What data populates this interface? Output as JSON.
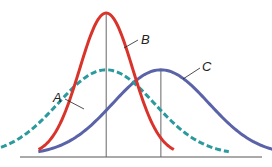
{
  "chart_data": {
    "type": "line",
    "title": "",
    "xlabel": "",
    "ylabel": "",
    "grid": false,
    "legend": "none (curves labeled directly)",
    "series": [
      {
        "name": "A",
        "label": "A",
        "mean": 0,
        "sd": 1.45,
        "peak": 0.6,
        "style": "dashed",
        "color": "#2a9a9e"
      },
      {
        "name": "B",
        "label": "B",
        "mean": 0,
        "sd": 0.8,
        "peak": 1.0,
        "style": "solid",
        "color": "#d9342b"
      },
      {
        "name": "C",
        "label": "C",
        "mean": 1.65,
        "sd": 1.45,
        "peak": 0.6,
        "style": "solid",
        "color": "#5a63a8"
      }
    ],
    "mean_lines": [
      {
        "for": "A,B",
        "x": 0
      },
      {
        "for": "C",
        "x": 1.65
      }
    ],
    "xlim": [
      -2.6,
      4.7
    ],
    "ylim": [
      0,
      1.0
    ]
  },
  "colors": {
    "axis": "#555555",
    "mean_line": "#666666",
    "leader": "#222222"
  }
}
